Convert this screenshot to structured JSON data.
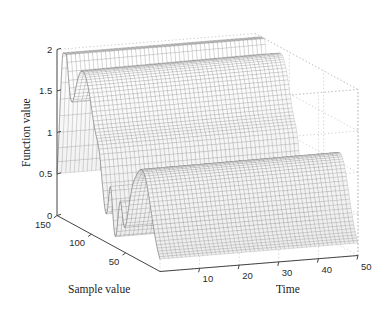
{
  "figure": {
    "background_color": "#ffffff",
    "mesh_color": "#555555",
    "box_color": "#c9c9c9",
    "axis_color": "#444444",
    "text_color": "#2b2b2b"
  },
  "axes": {
    "z": {
      "title": "Function value",
      "ticks": [
        "0",
        "0.5",
        "1",
        "1.5",
        "2"
      ],
      "values": [
        0,
        0.5,
        1,
        1.5,
        2
      ],
      "range": [
        0,
        2
      ]
    },
    "x": {
      "title": "Sample value",
      "ticks": [
        "150",
        "100",
        "50"
      ],
      "values": [
        150,
        100,
        50
      ],
      "range": [
        0,
        150
      ]
    },
    "y": {
      "title": "Time",
      "ticks": [
        "10",
        "20",
        "30",
        "40",
        "50"
      ],
      "values": [
        10,
        20,
        30,
        40,
        50
      ],
      "range": [
        0,
        50
      ]
    }
  },
  "chart_data": {
    "type": "line",
    "render_as": "3d-mesh-surface",
    "title": "",
    "xlabel": "Sample value",
    "ylabel": "Time",
    "zlabel": "Function value",
    "xlim": [
      0,
      150
    ],
    "ylim": [
      0,
      50
    ],
    "zlim": [
      0,
      2
    ],
    "grid": true,
    "legend": "none",
    "colormap": "grayscale",
    "x": [
      0,
      10,
      20,
      30,
      40,
      50,
      60,
      70,
      80,
      90,
      100,
      110,
      120,
      130,
      140,
      150
    ],
    "y": [
      0,
      10,
      20,
      30,
      40,
      50
    ],
    "ridges": [
      {
        "name": "tall-narrow-peak",
        "sample_value": 140,
        "peak_height": 1.85,
        "width": 12
      },
      {
        "name": "broad-high-plateau",
        "sample_value": 108,
        "peak_height": 1.75,
        "width": 30
      },
      {
        "name": "mid-spike",
        "sample_value": 72,
        "peak_height": 0.62,
        "width": 5
      },
      {
        "name": "mid-spike-2",
        "sample_value": 58,
        "peak_height": 0.55,
        "width": 5
      },
      {
        "name": "broad-low-ridge",
        "sample_value": 26,
        "peak_height": 1.12,
        "width": 26
      }
    ],
    "series": [
      {
        "name": "time=0",
        "values": [
          0.02,
          0.08,
          0.55,
          1.1,
          0.92,
          0.3,
          0.5,
          0.6,
          0.12,
          0.05,
          1.2,
          1.74,
          1.2,
          0.45,
          1.84,
          0.1
        ]
      },
      {
        "name": "time=10",
        "values": [
          0.02,
          0.08,
          0.55,
          1.11,
          0.93,
          0.3,
          0.5,
          0.6,
          0.12,
          0.05,
          1.21,
          1.75,
          1.21,
          0.45,
          1.85,
          0.1
        ]
      },
      {
        "name": "time=20",
        "values": [
          0.02,
          0.08,
          0.56,
          1.12,
          0.93,
          0.31,
          0.51,
          0.61,
          0.12,
          0.05,
          1.21,
          1.75,
          1.21,
          0.46,
          1.85,
          0.1
        ]
      },
      {
        "name": "time=30",
        "values": [
          0.02,
          0.08,
          0.56,
          1.12,
          0.94,
          0.31,
          0.51,
          0.61,
          0.13,
          0.05,
          1.22,
          1.76,
          1.22,
          0.46,
          1.85,
          0.1
        ]
      },
      {
        "name": "time=40",
        "values": [
          0.02,
          0.09,
          0.57,
          1.12,
          0.94,
          0.31,
          0.52,
          0.62,
          0.13,
          0.06,
          1.22,
          1.76,
          1.22,
          0.46,
          1.86,
          0.1
        ]
      },
      {
        "name": "time=50",
        "values": [
          0.02,
          0.09,
          0.57,
          1.13,
          0.95,
          0.32,
          0.52,
          0.62,
          0.13,
          0.06,
          1.23,
          1.76,
          1.23,
          0.47,
          1.86,
          0.1
        ]
      }
    ]
  }
}
